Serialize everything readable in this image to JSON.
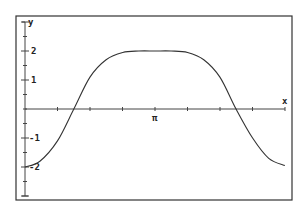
{
  "chart_data": {
    "type": "line",
    "title": "",
    "xlabel": "x",
    "ylabel": "y",
    "x_tick_label": "π",
    "y_tick_labels": [
      "2",
      "1",
      "-1",
      "-2"
    ],
    "y_ticks": [
      2,
      1,
      -1,
      -2
    ],
    "xlim": [
      0,
      6.283
    ],
    "ylim": [
      -3,
      3
    ],
    "grid": false,
    "legend": null,
    "x_tick_step": 0.785,
    "series": [
      {
        "name": "curve",
        "x": [
          0,
          0.36,
          0.785,
          1.18,
          1.57,
          1.96,
          2.36,
          2.75,
          3.14,
          3.53,
          3.93,
          4.32,
          4.71,
          5.1,
          5.5,
          5.89,
          6.28
        ],
        "y": [
          -2.0,
          -1.8,
          -1.1,
          0.0,
          1.1,
          1.7,
          1.95,
          2.0,
          2.0,
          2.0,
          1.95,
          1.7,
          1.1,
          0.0,
          -1.0,
          -1.7,
          -1.95
        ]
      }
    ]
  },
  "colors": {
    "frame": "#333333",
    "axis": "#444444",
    "curve": "#333333",
    "background": "#ffffff"
  }
}
